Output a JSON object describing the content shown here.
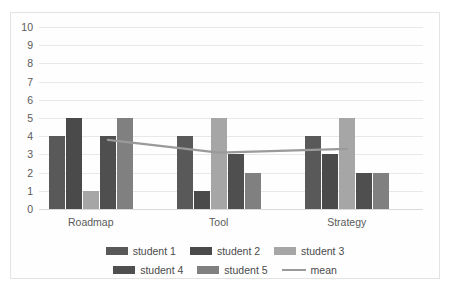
{
  "chart_data": {
    "type": "bar",
    "title": "",
    "xlabel": "",
    "ylabel": "",
    "ylim": [
      0,
      10
    ],
    "ytick_labels": [
      "10",
      "9",
      "8",
      "7",
      "6",
      "5",
      "4",
      "3",
      "2",
      "1",
      "0"
    ],
    "yticks": [
      10,
      9,
      8,
      7,
      6,
      5,
      4,
      3,
      2,
      1,
      0
    ],
    "grid": true,
    "legend_position": "bottom",
    "categories": [
      "Roadmap",
      "Tool",
      "Strategy"
    ],
    "series": [
      {
        "name": "student 1",
        "values": [
          4,
          4,
          4
        ],
        "color": "#595959",
        "type": "bar"
      },
      {
        "name": "student 2",
        "values": [
          5,
          1,
          3
        ],
        "color": "#4a4a4a",
        "type": "bar"
      },
      {
        "name": "student 3",
        "values": [
          1,
          5,
          5
        ],
        "color": "#a6a6a6",
        "type": "bar"
      },
      {
        "name": "student 4",
        "values": [
          4,
          3,
          2
        ],
        "color": "#4f4f4f",
        "type": "bar"
      },
      {
        "name": "student 5",
        "values": [
          5,
          2,
          2
        ],
        "color": "#808080",
        "type": "bar"
      }
    ],
    "overlay": {
      "name": "mean",
      "type": "line",
      "color": "#9a9a9a",
      "values": [
        3.8,
        3.1,
        3.3
      ],
      "anchor_note": "line spans from 4th bar of group 1 to 3rd bar of group 3"
    }
  },
  "legend": {
    "rows": [
      [
        {
          "label": "student 1",
          "swatch": "#595959",
          "kind": "swatch"
        },
        {
          "label": "student 2",
          "swatch": "#4a4a4a",
          "kind": "swatch"
        },
        {
          "label": "student 3",
          "swatch": "#a6a6a6",
          "kind": "swatch"
        }
      ],
      [
        {
          "label": "student 4",
          "swatch": "#4f4f4f",
          "kind": "swatch"
        },
        {
          "label": "student 5",
          "swatch": "#808080",
          "kind": "swatch"
        },
        {
          "label": "mean",
          "swatch": "#9a9a9a",
          "kind": "line"
        }
      ]
    ]
  }
}
